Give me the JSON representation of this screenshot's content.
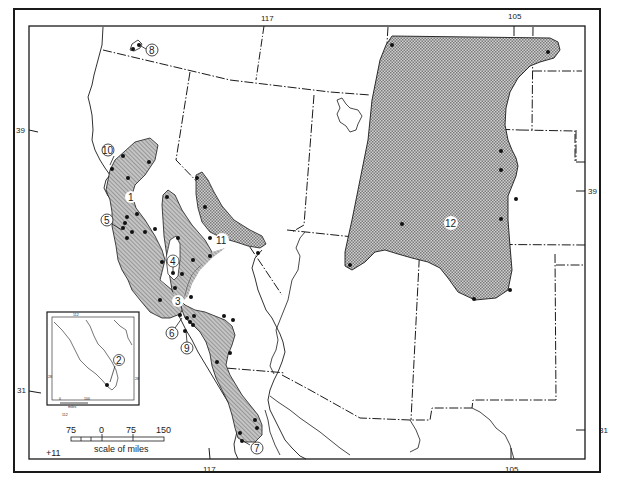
{
  "map": {
    "type": "distribution map",
    "colors": {
      "background": "#ffffff",
      "ink": "#1a1a1a",
      "fill": "#b8b8b8"
    },
    "graticule": {
      "top_labels": [
        "117",
        "105"
      ],
      "bottom_labels": [
        "117",
        "105"
      ],
      "left_labels": [
        "39",
        "31"
      ],
      "right_labels": [
        "39",
        "31"
      ]
    },
    "regions": [
      {
        "id": "1",
        "label": "1",
        "pattern": "diagonal-hatch"
      },
      {
        "id": "3",
        "label": "3",
        "pattern": "diagonal-hatch"
      },
      {
        "id": "4",
        "label": "4",
        "pattern": "diagonal-hatch"
      },
      {
        "id": "11",
        "label": "11",
        "pattern": "cross-hatch"
      },
      {
        "id": "12",
        "label": "12",
        "pattern": "cross-hatch"
      }
    ],
    "callouts": [
      {
        "id": "2",
        "label": "2"
      },
      {
        "id": "5",
        "label": "5"
      },
      {
        "id": "6",
        "label": "6"
      },
      {
        "id": "7",
        "label": "7"
      },
      {
        "id": "8",
        "label": "8"
      },
      {
        "id": "9",
        "label": "9"
      },
      {
        "id": "10",
        "label": "10"
      }
    ],
    "inset": {
      "top_label": "112",
      "bottom_label": "112",
      "left_label": "28",
      "right_label": "28",
      "scale_left": "0",
      "scale_right": "100",
      "scale_unit": "miles",
      "callout": "2"
    },
    "scale_bar": {
      "ticks": [
        "75",
        "0",
        "75",
        "150"
      ],
      "caption": "scale of miles"
    },
    "signature": "+11"
  }
}
